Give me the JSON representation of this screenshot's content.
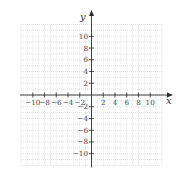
{
  "chart_data": {
    "type": "coordinate_grid",
    "title": "",
    "xlabel": "x",
    "ylabel": "y",
    "xlim": [
      -12,
      12
    ],
    "ylim": [
      -12,
      12
    ],
    "grid": true,
    "grid_step": 1,
    "tick_step": 2,
    "x_tick_labels": [
      "-10",
      "-8",
      "-6",
      "-4",
      "-2",
      "2",
      "4",
      "6",
      "8",
      "10"
    ],
    "y_tick_labels": [
      "10",
      "8",
      "6",
      "4",
      "2",
      "-2",
      "-4",
      "-6",
      "-8",
      "-10"
    ],
    "x_ticks": [
      -10,
      -8,
      -6,
      -4,
      -2,
      2,
      4,
      6,
      8,
      10
    ],
    "y_ticks": [
      10,
      8,
      6,
      4,
      2,
      -2,
      -4,
      -6,
      -8,
      -10
    ],
    "series": []
  },
  "colors": {
    "axis": "#2b2b2b",
    "grid": "#c8c8c8",
    "label": "#444444"
  }
}
